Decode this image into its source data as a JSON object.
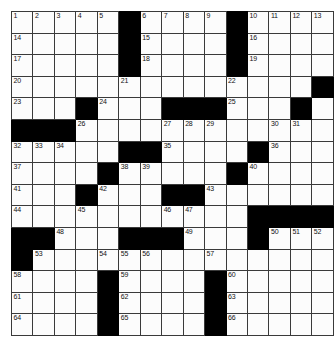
{
  "puzzle": {
    "type": "crossword-grid",
    "title": "",
    "rows": 15,
    "cols": 15,
    "cell_size_px": 21,
    "colors": {
      "block": "#000000",
      "cell": "#fcfcfc",
      "gridline": "#3a3a3a",
      "number": "#111111",
      "background": "#ffffff"
    },
    "highest_clue_number": 66,
    "grid": [
      [
        {
          "block": false,
          "num": "1"
        },
        {
          "block": false,
          "num": "2"
        },
        {
          "block": false,
          "num": "3"
        },
        {
          "block": false,
          "num": "4"
        },
        {
          "block": false,
          "num": "5"
        },
        {
          "block": true,
          "num": ""
        },
        {
          "block": false,
          "num": "6"
        },
        {
          "block": false,
          "num": "7"
        },
        {
          "block": false,
          "num": "8"
        },
        {
          "block": false,
          "num": "9"
        },
        {
          "block": true,
          "num": ""
        },
        {
          "block": false,
          "num": "10"
        },
        {
          "block": false,
          "num": "11"
        },
        {
          "block": false,
          "num": "12"
        },
        {
          "block": false,
          "num": "13"
        }
      ],
      [
        {
          "block": false,
          "num": "14"
        },
        {
          "block": false,
          "num": ""
        },
        {
          "block": false,
          "num": ""
        },
        {
          "block": false,
          "num": ""
        },
        {
          "block": false,
          "num": ""
        },
        {
          "block": true,
          "num": ""
        },
        {
          "block": false,
          "num": "15"
        },
        {
          "block": false,
          "num": ""
        },
        {
          "block": false,
          "num": ""
        },
        {
          "block": false,
          "num": ""
        },
        {
          "block": true,
          "num": ""
        },
        {
          "block": false,
          "num": "16"
        },
        {
          "block": false,
          "num": ""
        },
        {
          "block": false,
          "num": ""
        },
        {
          "block": false,
          "num": ""
        }
      ],
      [
        {
          "block": false,
          "num": "17"
        },
        {
          "block": false,
          "num": ""
        },
        {
          "block": false,
          "num": ""
        },
        {
          "block": false,
          "num": ""
        },
        {
          "block": false,
          "num": ""
        },
        {
          "block": true,
          "num": ""
        },
        {
          "block": false,
          "num": "18"
        },
        {
          "block": false,
          "num": ""
        },
        {
          "block": false,
          "num": ""
        },
        {
          "block": false,
          "num": ""
        },
        {
          "block": true,
          "num": ""
        },
        {
          "block": false,
          "num": "19"
        },
        {
          "block": false,
          "num": ""
        },
        {
          "block": false,
          "num": ""
        },
        {
          "block": false,
          "num": ""
        }
      ],
      [
        {
          "block": false,
          "num": "20"
        },
        {
          "block": false,
          "num": ""
        },
        {
          "block": false,
          "num": ""
        },
        {
          "block": false,
          "num": ""
        },
        {
          "block": false,
          "num": ""
        },
        {
          "block": false,
          "num": "21"
        },
        {
          "block": false,
          "num": ""
        },
        {
          "block": false,
          "num": ""
        },
        {
          "block": false,
          "num": ""
        },
        {
          "block": false,
          "num": ""
        },
        {
          "block": false,
          "num": "22"
        },
        {
          "block": false,
          "num": ""
        },
        {
          "block": false,
          "num": ""
        },
        {
          "block": false,
          "num": ""
        },
        {
          "block": true,
          "num": ""
        }
      ],
      [
        {
          "block": false,
          "num": "23"
        },
        {
          "block": false,
          "num": ""
        },
        {
          "block": false,
          "num": ""
        },
        {
          "block": true,
          "num": ""
        },
        {
          "block": false,
          "num": "24"
        },
        {
          "block": false,
          "num": ""
        },
        {
          "block": false,
          "num": ""
        },
        {
          "block": true,
          "num": ""
        },
        {
          "block": true,
          "num": ""
        },
        {
          "block": true,
          "num": ""
        },
        {
          "block": false,
          "num": "25"
        },
        {
          "block": false,
          "num": ""
        },
        {
          "block": false,
          "num": ""
        },
        {
          "block": true,
          "num": ""
        },
        {
          "block": false,
          "num": ""
        }
      ],
      [
        {
          "block": true,
          "num": ""
        },
        {
          "block": true,
          "num": ""
        },
        {
          "block": true,
          "num": ""
        },
        {
          "block": false,
          "num": "26"
        },
        {
          "block": false,
          "num": ""
        },
        {
          "block": false,
          "num": ""
        },
        {
          "block": false,
          "num": ""
        },
        {
          "block": false,
          "num": "27"
        },
        {
          "block": false,
          "num": "28"
        },
        {
          "block": false,
          "num": "29"
        },
        {
          "block": false,
          "num": ""
        },
        {
          "block": false,
          "num": ""
        },
        {
          "block": false,
          "num": "30"
        },
        {
          "block": false,
          "num": "31"
        },
        {
          "block": false,
          "num": ""
        }
      ],
      [
        {
          "block": false,
          "num": "32"
        },
        {
          "block": false,
          "num": "33"
        },
        {
          "block": false,
          "num": "34"
        },
        {
          "block": false,
          "num": ""
        },
        {
          "block": false,
          "num": ""
        },
        {
          "block": true,
          "num": ""
        },
        {
          "block": true,
          "num": ""
        },
        {
          "block": false,
          "num": "35"
        },
        {
          "block": false,
          "num": ""
        },
        {
          "block": false,
          "num": ""
        },
        {
          "block": false,
          "num": ""
        },
        {
          "block": true,
          "num": ""
        },
        {
          "block": false,
          "num": "36"
        },
        {
          "block": false,
          "num": ""
        },
        {
          "block": false,
          "num": ""
        }
      ],
      [
        {
          "block": false,
          "num": "37"
        },
        {
          "block": false,
          "num": ""
        },
        {
          "block": false,
          "num": ""
        },
        {
          "block": false,
          "num": ""
        },
        {
          "block": true,
          "num": ""
        },
        {
          "block": false,
          "num": "38"
        },
        {
          "block": false,
          "num": "39"
        },
        {
          "block": false,
          "num": ""
        },
        {
          "block": false,
          "num": ""
        },
        {
          "block": false,
          "num": ""
        },
        {
          "block": true,
          "num": ""
        },
        {
          "block": false,
          "num": "40"
        },
        {
          "block": false,
          "num": ""
        },
        {
          "block": false,
          "num": ""
        },
        {
          "block": false,
          "num": ""
        }
      ],
      [
        {
          "block": false,
          "num": "41"
        },
        {
          "block": false,
          "num": ""
        },
        {
          "block": false,
          "num": ""
        },
        {
          "block": true,
          "num": ""
        },
        {
          "block": false,
          "num": "42"
        },
        {
          "block": false,
          "num": ""
        },
        {
          "block": false,
          "num": ""
        },
        {
          "block": true,
          "num": ""
        },
        {
          "block": true,
          "num": ""
        },
        {
          "block": false,
          "num": "43"
        },
        {
          "block": false,
          "num": ""
        },
        {
          "block": false,
          "num": ""
        },
        {
          "block": false,
          "num": ""
        },
        {
          "block": false,
          "num": ""
        },
        {
          "block": false,
          "num": ""
        }
      ],
      [
        {
          "block": false,
          "num": "44"
        },
        {
          "block": false,
          "num": ""
        },
        {
          "block": false,
          "num": ""
        },
        {
          "block": false,
          "num": "45"
        },
        {
          "block": false,
          "num": ""
        },
        {
          "block": false,
          "num": ""
        },
        {
          "block": false,
          "num": ""
        },
        {
          "block": false,
          "num": "46"
        },
        {
          "block": false,
          "num": "47"
        },
        {
          "block": false,
          "num": ""
        },
        {
          "block": false,
          "num": ""
        },
        {
          "block": true,
          "num": ""
        },
        {
          "block": true,
          "num": ""
        },
        {
          "block": true,
          "num": ""
        },
        {
          "block": true,
          "num": ""
        }
      ],
      [
        {
          "block": true,
          "num": ""
        },
        {
          "block": true,
          "num": ""
        },
        {
          "block": false,
          "num": "48"
        },
        {
          "block": false,
          "num": ""
        },
        {
          "block": false,
          "num": ""
        },
        {
          "block": true,
          "num": ""
        },
        {
          "block": true,
          "num": ""
        },
        {
          "block": true,
          "num": ""
        },
        {
          "block": false,
          "num": "49"
        },
        {
          "block": false,
          "num": ""
        },
        {
          "block": false,
          "num": ""
        },
        {
          "block": true,
          "num": ""
        },
        {
          "block": false,
          "num": "50"
        },
        {
          "block": false,
          "num": "51"
        },
        {
          "block": false,
          "num": "52"
        }
      ],
      [
        {
          "block": true,
          "num": ""
        },
        {
          "block": false,
          "num": "53"
        },
        {
          "block": false,
          "num": ""
        },
        {
          "block": false,
          "num": ""
        },
        {
          "block": false,
          "num": "54"
        },
        {
          "block": false,
          "num": "55"
        },
        {
          "block": false,
          "num": "56"
        },
        {
          "block": false,
          "num": ""
        },
        {
          "block": false,
          "num": ""
        },
        {
          "block": false,
          "num": "57"
        },
        {
          "block": false,
          "num": ""
        },
        {
          "block": false,
          "num": ""
        },
        {
          "block": false,
          "num": ""
        },
        {
          "block": false,
          "num": ""
        },
        {
          "block": false,
          "num": ""
        }
      ],
      [
        {
          "block": false,
          "num": "58"
        },
        {
          "block": false,
          "num": ""
        },
        {
          "block": false,
          "num": ""
        },
        {
          "block": false,
          "num": ""
        },
        {
          "block": true,
          "num": ""
        },
        {
          "block": false,
          "num": "59"
        },
        {
          "block": false,
          "num": ""
        },
        {
          "block": false,
          "num": ""
        },
        {
          "block": false,
          "num": ""
        },
        {
          "block": true,
          "num": ""
        },
        {
          "block": false,
          "num": "60"
        },
        {
          "block": false,
          "num": ""
        },
        {
          "block": false,
          "num": ""
        },
        {
          "block": false,
          "num": ""
        },
        {
          "block": false,
          "num": ""
        }
      ],
      [
        {
          "block": false,
          "num": "61"
        },
        {
          "block": false,
          "num": ""
        },
        {
          "block": false,
          "num": ""
        },
        {
          "block": false,
          "num": ""
        },
        {
          "block": true,
          "num": ""
        },
        {
          "block": false,
          "num": "62"
        },
        {
          "block": false,
          "num": ""
        },
        {
          "block": false,
          "num": ""
        },
        {
          "block": false,
          "num": ""
        },
        {
          "block": true,
          "num": ""
        },
        {
          "block": false,
          "num": "63"
        },
        {
          "block": false,
          "num": ""
        },
        {
          "block": false,
          "num": ""
        },
        {
          "block": false,
          "num": ""
        },
        {
          "block": false,
          "num": ""
        }
      ],
      [
        {
          "block": false,
          "num": "64"
        },
        {
          "block": false,
          "num": ""
        },
        {
          "block": false,
          "num": ""
        },
        {
          "block": false,
          "num": ""
        },
        {
          "block": true,
          "num": ""
        },
        {
          "block": false,
          "num": "65"
        },
        {
          "block": false,
          "num": ""
        },
        {
          "block": false,
          "num": ""
        },
        {
          "block": false,
          "num": ""
        },
        {
          "block": true,
          "num": ""
        },
        {
          "block": false,
          "num": "66"
        },
        {
          "block": false,
          "num": ""
        },
        {
          "block": false,
          "num": ""
        },
        {
          "block": false,
          "num": ""
        },
        {
          "block": false,
          "num": ""
        }
      ]
    ]
  }
}
